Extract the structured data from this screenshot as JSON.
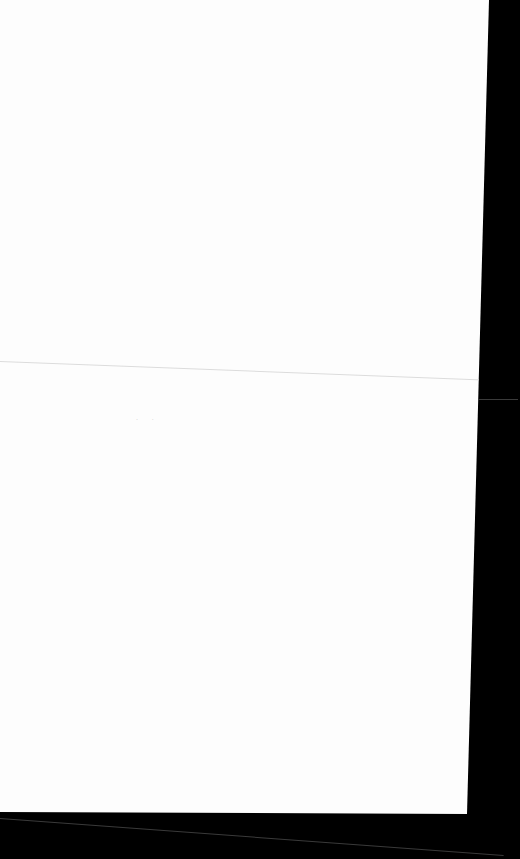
{
  "document": {
    "type": "scanned blank page",
    "background_color": "#000000",
    "paper_color": "#fdfdfd",
    "marks": "· ·"
  }
}
